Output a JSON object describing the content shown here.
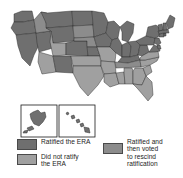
{
  "figure": {
    "kind": "choropleth-map",
    "background_color": "#ffffff"
  },
  "colors": {
    "ratified": "#6f6f6f",
    "not_ratified": "#a0a0a0",
    "rescinded": "#8c8c8c",
    "border": "#2b2b2b",
    "inset_border": "#1a1a1a",
    "text": "#1c1c1c"
  },
  "insets": [
    {
      "name": "alaska-inset",
      "fill_key": "ratified"
    },
    {
      "name": "hawaii-inset",
      "fill_key": "ratified"
    }
  ],
  "legend": {
    "left_entries": [
      {
        "swatch_color": "#6f6f6f",
        "label": "Ratified the ERA"
      },
      {
        "swatch_color": "#a0a0a0",
        "label": "Did not ratify\nthe ERA"
      }
    ],
    "right_entries": [
      {
        "swatch_color": "#8c8c8c",
        "label": "Ratified and\nthen voted\nto rescind\nratification"
      }
    ]
  },
  "map_data": {
    "type": "choropleth",
    "categories": [
      "Ratified the ERA",
      "Did not ratify the ERA",
      "Ratified and then voted to rescind ratification"
    ],
    "states": [
      {
        "code": "WA",
        "status": "ratified"
      },
      {
        "code": "OR",
        "status": "ratified"
      },
      {
        "code": "CA",
        "status": "ratified"
      },
      {
        "code": "ID",
        "status": "rescinded"
      },
      {
        "code": "NV",
        "status": "ratified"
      },
      {
        "code": "MT",
        "status": "ratified"
      },
      {
        "code": "WY",
        "status": "ratified"
      },
      {
        "code": "UT",
        "status": "not_ratified"
      },
      {
        "code": "AZ",
        "status": "not_ratified"
      },
      {
        "code": "CO",
        "status": "ratified"
      },
      {
        "code": "NM",
        "status": "ratified"
      },
      {
        "code": "ND",
        "status": "ratified"
      },
      {
        "code": "SD",
        "status": "rescinded"
      },
      {
        "code": "NE",
        "status": "rescinded"
      },
      {
        "code": "KS",
        "status": "ratified"
      },
      {
        "code": "OK",
        "status": "not_ratified"
      },
      {
        "code": "TX",
        "status": "not_ratified"
      },
      {
        "code": "MN",
        "status": "ratified"
      },
      {
        "code": "IA",
        "status": "ratified"
      },
      {
        "code": "MO",
        "status": "not_ratified"
      },
      {
        "code": "AR",
        "status": "not_ratified"
      },
      {
        "code": "LA",
        "status": "not_ratified"
      },
      {
        "code": "WI",
        "status": "ratified"
      },
      {
        "code": "IL",
        "status": "ratified"
      },
      {
        "code": "MS",
        "status": "not_ratified"
      },
      {
        "code": "MI",
        "status": "ratified"
      },
      {
        "code": "IN",
        "status": "ratified"
      },
      {
        "code": "KY",
        "status": "ratified"
      },
      {
        "code": "TN",
        "status": "rescinded"
      },
      {
        "code": "AL",
        "status": "not_ratified"
      },
      {
        "code": "OH",
        "status": "ratified"
      },
      {
        "code": "WV",
        "status": "ratified"
      },
      {
        "code": "GA",
        "status": "not_ratified"
      },
      {
        "code": "FL",
        "status": "not_ratified"
      },
      {
        "code": "SC",
        "status": "not_ratified"
      },
      {
        "code": "NC",
        "status": "not_ratified"
      },
      {
        "code": "VA",
        "status": "not_ratified"
      },
      {
        "code": "PA",
        "status": "ratified"
      },
      {
        "code": "NY",
        "status": "ratified"
      },
      {
        "code": "MD",
        "status": "ratified"
      },
      {
        "code": "DE",
        "status": "ratified"
      },
      {
        "code": "NJ",
        "status": "ratified"
      },
      {
        "code": "CT",
        "status": "ratified"
      },
      {
        "code": "RI",
        "status": "ratified"
      },
      {
        "code": "MA",
        "status": "ratified"
      },
      {
        "code": "VT",
        "status": "ratified"
      },
      {
        "code": "NH",
        "status": "ratified"
      },
      {
        "code": "ME",
        "status": "ratified"
      },
      {
        "code": "AK",
        "status": "ratified"
      },
      {
        "code": "HI",
        "status": "ratified"
      }
    ]
  }
}
